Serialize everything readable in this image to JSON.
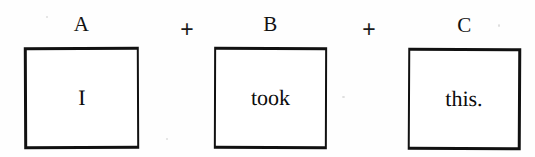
{
  "figure": {
    "kind": "formula-diagram",
    "sentence": "I took this.",
    "background_color": "#fefefe",
    "ink_color": "#111111",
    "operators": [
      {
        "symbol": "+",
        "name": "plus-operator-1"
      },
      {
        "symbol": "+",
        "name": "plus-operator-2"
      }
    ],
    "constituents": [
      {
        "label": "A",
        "text": "I",
        "box": {
          "x": 24,
          "y": 47,
          "width": 115,
          "height": 102
        },
        "label_pos": {
          "x": 24,
          "y": 14,
          "width": 115
        }
      },
      {
        "label": "B",
        "text": "took",
        "box": {
          "x": 214,
          "y": 47,
          "width": 113,
          "height": 102
        },
        "label_pos": {
          "x": 214,
          "y": 14,
          "width": 113
        }
      },
      {
        "label": "C",
        "text": "this.",
        "box": {
          "x": 408,
          "y": 48,
          "width": 113,
          "height": 102
        },
        "label_pos": {
          "x": 408,
          "y": 14,
          "width": 113
        }
      }
    ],
    "operator_positions": [
      {
        "x": 176,
        "y": 18
      },
      {
        "x": 358,
        "y": 18
      }
    ]
  }
}
